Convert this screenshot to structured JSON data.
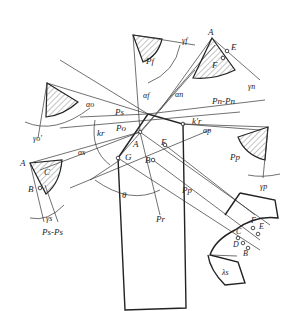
{
  "diagram": {
    "labels": {
      "top_center": {
        "plane": "Pf",
        "angle_rake": "γf",
        "angle_clearance": "αf"
      },
      "top_right": {
        "apex": "A",
        "point_e": "E",
        "point_f": "F",
        "plane": "Pn-Pn",
        "angle_rake": "γn",
        "angle_clearance": "αn"
      },
      "left": {
        "angle_clearance": "αo",
        "angle_rake": "γo'"
      },
      "center": {
        "plane_s": "Ps",
        "plane_o": "Po",
        "plane_r": "Pr",
        "angle_kr": "kr",
        "angle_kr_prime": "k'r",
        "angle_theta": "θ",
        "point_a": "A",
        "point_b": "B",
        "point_e": "E",
        "point_g": "G",
        "plane_p": "Pp"
      },
      "right": {
        "plane": "Pp",
        "angle_clearance": "αp",
        "angle_rake": "γp"
      },
      "lower_left": {
        "apex": "A",
        "point_b": "B",
        "region": "C",
        "angle_clearance": "αs",
        "angle_rake": "γs",
        "plane": "Ps-Ps"
      },
      "lower_right": {
        "point_c": "C",
        "point_d": "D",
        "point_e": "E",
        "point_f": "F",
        "point_b": "B",
        "angle_lambda": "λs"
      }
    }
  }
}
